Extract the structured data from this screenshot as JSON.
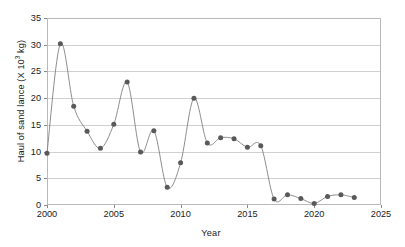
{
  "chart_data": {
    "type": "line",
    "title": "",
    "xlabel": "Year",
    "ylabel": "Haul of sand lance (X 10^3 kg)",
    "ylabel_prefix": "Haul of sand lance (X 10",
    "ylabel_exponent": "3",
    "ylabel_suffix": " kg)",
    "xlim": [
      2000,
      2025
    ],
    "ylim": [
      0,
      35
    ],
    "xticks": [
      2000,
      2005,
      2010,
      2015,
      2020,
      2025
    ],
    "yticks": [
      0,
      5,
      10,
      15,
      20,
      25,
      30,
      35
    ],
    "grid": "horizontal",
    "legend": "none",
    "marker": "filled-circle",
    "marker_color": "#595959",
    "line_color": "#808080",
    "axis_color": "#b9b9b9",
    "grid_color": "#d0d0d0",
    "x": [
      2000,
      2001,
      2002,
      2003,
      2004,
      2005,
      2006,
      2007,
      2008,
      2009,
      2010,
      2011,
      2012,
      2013,
      2014,
      2015,
      2016,
      2017,
      2018,
      2019,
      2020,
      2021,
      2022,
      2023
    ],
    "values": [
      9.7,
      30.2,
      18.5,
      13.8,
      10.6,
      15.1,
      23.0,
      9.9,
      13.9,
      3.3,
      7.9,
      20.0,
      11.6,
      12.6,
      12.4,
      10.8,
      11.1,
      1.1,
      1.9,
      1.2,
      0.3,
      1.6,
      1.9,
      1.4
    ],
    "series": [
      {
        "name": "Haul of sand lance",
        "values": [
          9.7,
          30.2,
          18.5,
          13.8,
          10.6,
          15.1,
          23.0,
          9.9,
          13.9,
          3.3,
          7.9,
          20.0,
          11.6,
          12.6,
          12.4,
          10.8,
          11.1,
          1.1,
          1.9,
          1.2,
          0.3,
          1.6,
          1.9,
          1.4
        ]
      }
    ]
  }
}
